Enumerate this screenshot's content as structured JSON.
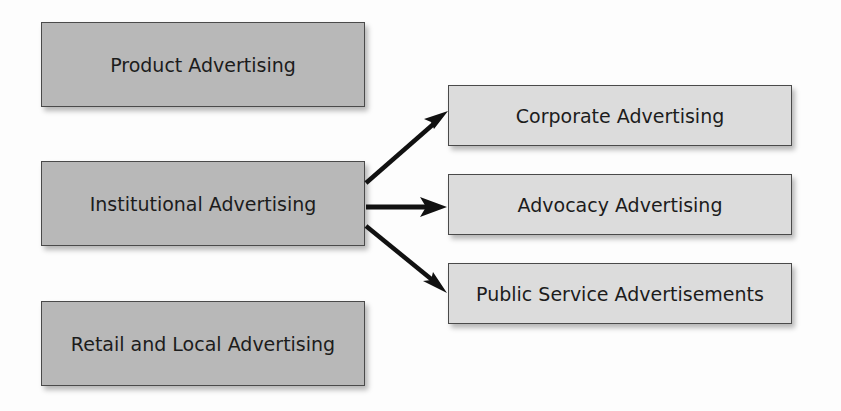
{
  "diagram": {
    "type": "hierarchy",
    "colors": {
      "primary_box_fill": "#b8b8b8",
      "secondary_box_fill": "#dcdcdc",
      "border": "#4a4a4a",
      "arrow": "#111111",
      "text": "#1c1c1c"
    },
    "primary_categories": [
      {
        "id": "product",
        "label": "Product Advertising"
      },
      {
        "id": "institutional",
        "label": "Institutional Advertising"
      },
      {
        "id": "retail",
        "label": "Retail and Local Advertising"
      }
    ],
    "institutional_subtypes": [
      {
        "id": "corporate",
        "label": "Corporate Advertising"
      },
      {
        "id": "advocacy",
        "label": "Advocacy Advertising"
      },
      {
        "id": "public",
        "label": "Public Service Advertisements"
      }
    ],
    "edges": [
      {
        "from": "institutional",
        "to": "corporate"
      },
      {
        "from": "institutional",
        "to": "advocacy"
      },
      {
        "from": "institutional",
        "to": "public"
      }
    ]
  }
}
